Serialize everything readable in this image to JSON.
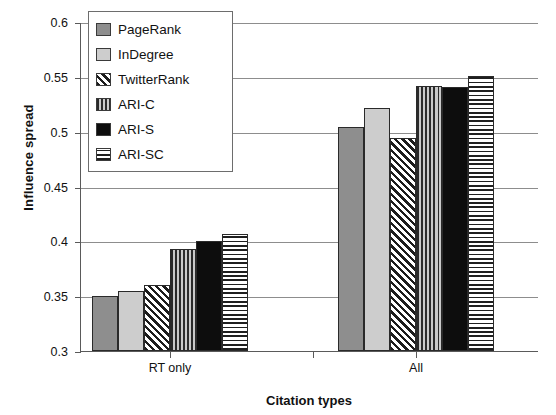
{
  "chart_data": {
    "type": "bar",
    "title": "",
    "xlabel": "Citation types",
    "ylabel": "Influence spread",
    "categories": [
      "RT only",
      "All"
    ],
    "ylim": [
      0.3,
      0.6
    ],
    "yticks": [
      "0.3",
      "0.35",
      "0.4",
      "0.45",
      "0.5",
      "0.55",
      "0.6"
    ],
    "ytick_values": [
      0.3,
      0.35,
      0.4,
      0.45,
      0.5,
      0.55,
      0.6
    ],
    "grid": true,
    "legend_position": "top-left inside",
    "series": [
      {
        "name": "PageRank",
        "values": [
          0.35,
          0.504
        ],
        "color": "#8e8e8e",
        "pattern": "solid-gray"
      },
      {
        "name": "InDegree",
        "values": [
          0.355,
          0.522
        ],
        "color": "#cdcdcd",
        "pattern": "solid-light-gray"
      },
      {
        "name": "TwitterRank",
        "values": [
          0.36,
          0.494
        ],
        "color": "#1c1c1c",
        "pattern": "diagonal-hatch"
      },
      {
        "name": "ARI-C",
        "values": [
          0.393,
          0.542
        ],
        "color": "#2a2a2a",
        "pattern": "vertical-lines"
      },
      {
        "name": "ARI-S",
        "values": [
          0.4,
          0.541
        ],
        "color": "#0d0d0d",
        "pattern": "solid-black"
      },
      {
        "name": "ARI-SC",
        "values": [
          0.407,
          0.551
        ],
        "color": "#1f1f1f",
        "pattern": "horizontal-lines"
      }
    ]
  },
  "legend": {
    "items": [
      {
        "label": "PageRank"
      },
      {
        "label": "InDegree"
      },
      {
        "label": "TwitterRank"
      },
      {
        "label": "ARI-C"
      },
      {
        "label": "ARI-S"
      },
      {
        "label": "ARI-SC"
      }
    ]
  }
}
